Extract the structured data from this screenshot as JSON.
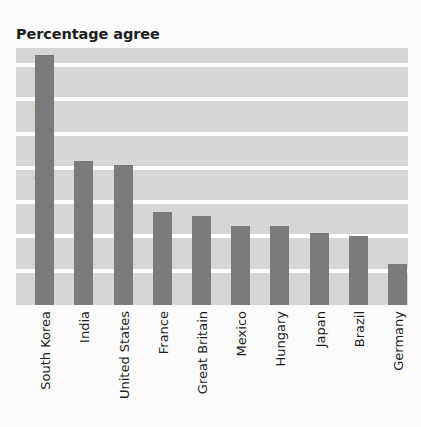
{
  "chart_data": {
    "type": "bar",
    "title": "Percentage agree",
    "xlabel": "",
    "ylabel": "",
    "categories": [
      "South Korea",
      "India",
      "United States",
      "France",
      "Great Britain",
      "Mexico",
      "Hungary",
      "Japan",
      "Brazil",
      "Germany"
    ],
    "values": [
      73,
      42,
      41,
      27,
      26,
      23,
      23,
      21,
      20,
      12
    ],
    "yticks": [
      70,
      60,
      50,
      40,
      30,
      20,
      10
    ],
    "ylim": [
      0,
      75
    ],
    "grid": true,
    "legend": null,
    "colors": {
      "bar": "#7b7b7b",
      "plot_background": "#d6d6d6",
      "gridline": "#fdfdfd",
      "text": "#1d1d1d",
      "canvas": "#fbfbfb"
    }
  }
}
